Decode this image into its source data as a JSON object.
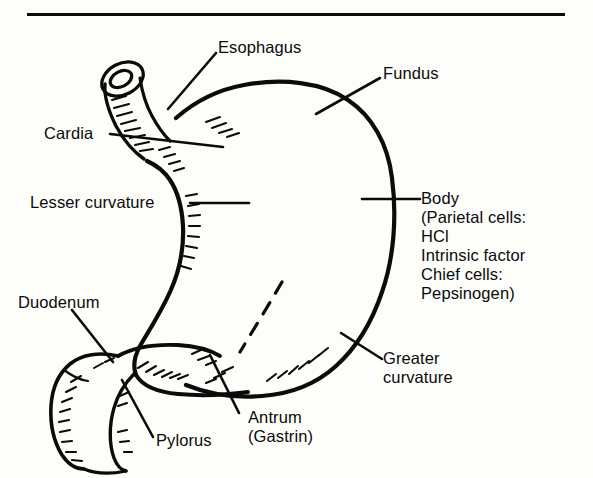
{
  "figure": {
    "type": "line-drawing",
    "ink_color": "#0b0b0b",
    "background_color": "#fdfdfa",
    "top_rule": true
  },
  "labels": {
    "esophagus": "Esophagus",
    "fundus": "Fundus",
    "cardia": "Cardia",
    "lesser_curvature": "Lesser curvature",
    "body": "Body\n (Parietal cells:\n    HCl\n     Intrinsic factor\n Chief cells:\n    Pepsinogen)",
    "greater_curvature": "Greater\ncurvature",
    "duodenum": "Duodenum",
    "pylorus": "Pylorus",
    "antrum": "Antrum\n(Gastrin)"
  }
}
